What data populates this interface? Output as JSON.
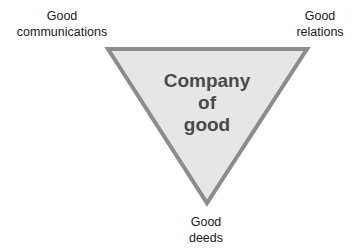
{
  "diagram": {
    "type": "inverted-triangle",
    "center_label": [
      "Company",
      "of",
      "good"
    ],
    "vertices": {
      "top_left": [
        "Good",
        "communications"
      ],
      "top_right": [
        "Good",
        "relations"
      ],
      "bottom": [
        "Good",
        "deeds"
      ]
    },
    "colors": {
      "fill": "#e6e6e6",
      "stroke": "#8c8c8c",
      "center_text": "#4a4a4a",
      "label_text": "#1a1a1a"
    }
  }
}
